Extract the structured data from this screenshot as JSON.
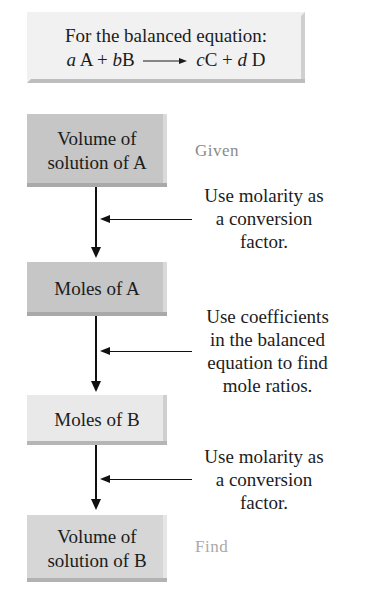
{
  "header": {
    "title": "For the balanced equation:",
    "equation": {
      "coef_a": "a",
      "species_a": "A",
      "plus1": "+",
      "coef_b": "b",
      "species_b": "B",
      "coef_c": "c",
      "species_c": "C",
      "plus2": "+",
      "coef_d": "d",
      "species_d": "D"
    }
  },
  "steps": [
    {
      "line1": "Volume of",
      "line2": "solution of A",
      "tag": "Given"
    },
    {
      "line1": "Moles of A"
    },
    {
      "line1": "Moles of B"
    },
    {
      "line1": "Volume of",
      "line2": "solution of B",
      "tag": "Find"
    }
  ],
  "conversions": [
    {
      "lines": [
        "Use molarity as",
        "a conversion",
        "factor."
      ]
    },
    {
      "lines": [
        "Use coefficients",
        "in the balanced",
        "equation to find",
        "mole ratios."
      ]
    },
    {
      "lines": [
        "Use molarity as",
        "a conversion",
        "factor."
      ]
    }
  ]
}
